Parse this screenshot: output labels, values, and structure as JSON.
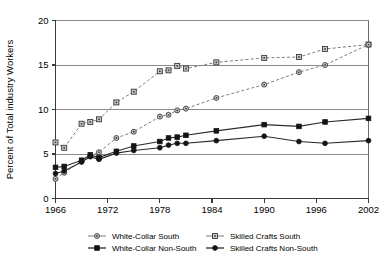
{
  "chart_data": {
    "type": "line",
    "title": "",
    "xlabel": "",
    "ylabel": "Percent of Total industry Workers",
    "xlim": [
      1966,
      2002
    ],
    "ylim": [
      0,
      20
    ],
    "xticks": [
      1966,
      1972,
      1978,
      1984,
      1990,
      1996,
      2002
    ],
    "yticks": [
      0,
      5,
      10,
      15,
      20
    ],
    "grid": "horizontal",
    "legend_position": "bottom",
    "series": [
      {
        "name": "White-Collar  South",
        "style": "dashed",
        "marker": "open-circle",
        "color": "#7d7d7d",
        "x": [
          1966,
          1967,
          1969,
          1970,
          1971,
          1973,
          1975,
          1978,
          1979,
          1980,
          1981,
          1984.5,
          1990,
          1994,
          1997,
          2002
        ],
        "values": [
          2.2,
          2.9,
          4.2,
          4.8,
          5.2,
          6.8,
          7.5,
          9.2,
          9.4,
          9.9,
          10.1,
          11.3,
          12.8,
          14.2,
          15.0,
          17.3
        ]
      },
      {
        "name": "Skilled Crafts South",
        "style": "dashed",
        "marker": "open-square",
        "color": "#7d7d7d",
        "x": [
          1966,
          1967,
          1969,
          1970,
          1971,
          1973,
          1975,
          1978,
          1979,
          1980,
          1981,
          1984.5,
          1990,
          1994,
          1997,
          2002
        ],
        "values": [
          6.3,
          5.7,
          8.4,
          8.6,
          8.9,
          10.8,
          12.0,
          14.3,
          14.4,
          14.9,
          14.6,
          15.3,
          15.8,
          15.9,
          16.8,
          17.3
        ]
      },
      {
        "name": "White-Collar Non-South",
        "style": "solid",
        "marker": "filled-square",
        "color": "#2b2b2b",
        "x": [
          1966,
          1967,
          1969,
          1970,
          1971,
          1973,
          1975,
          1978,
          1979,
          1980,
          1981,
          1984.5,
          1990,
          1994,
          1997,
          2002
        ],
        "values": [
          3.5,
          3.6,
          4.3,
          4.9,
          4.6,
          5.3,
          5.9,
          6.4,
          6.8,
          6.9,
          7.1,
          7.6,
          8.3,
          8.1,
          8.6,
          9.0
        ]
      },
      {
        "name": "Skilled Crafts Non-South",
        "style": "solid",
        "marker": "filled-circle",
        "color": "#141414",
        "x": [
          1966,
          1967,
          1969,
          1970,
          1971,
          1973,
          1975,
          1978,
          1979,
          1980,
          1981,
          1984.5,
          1990,
          1994,
          1997,
          2002
        ],
        "values": [
          2.8,
          3.1,
          4.1,
          4.7,
          4.4,
          5.1,
          5.4,
          5.7,
          6.0,
          6.2,
          6.2,
          6.5,
          7.0,
          6.4,
          6.2,
          6.5
        ]
      }
    ]
  },
  "legend": {
    "entries": [
      {
        "label": "White-Collar  South",
        "series": 0
      },
      {
        "label": "Skilled Crafts South",
        "series": 1
      },
      {
        "label": "White-Collar Non-South",
        "series": 2
      },
      {
        "label": "Skilled Crafts Non-South",
        "series": 3
      }
    ]
  }
}
